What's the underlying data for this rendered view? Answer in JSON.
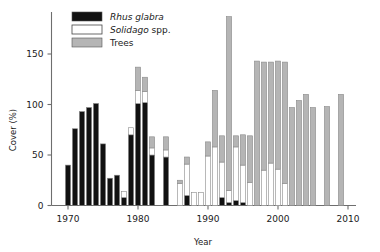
{
  "chart_data": {
    "type": "bar",
    "subtype": "stacked-vertical",
    "title": "",
    "xlabel": "Year",
    "ylabel": "Cover (%)",
    "xlim": [
      1968,
      2010
    ],
    "ylim": [
      0,
      190
    ],
    "xticks": [
      1970,
      1980,
      1990,
      2000,
      2010
    ],
    "yticks": [
      0,
      50,
      100,
      150
    ],
    "grid": false,
    "legend_position": "top-left",
    "legend": [
      {
        "name": "Rhus glabra",
        "italic": true,
        "color": "#111111"
      },
      {
        "name": "Solidago spp.",
        "italic_prefix": "Solidago",
        "plain_suffix": " spp.",
        "color": "#ffffff"
      },
      {
        "name": "Trees",
        "italic": false,
        "color": "#b5b5b5"
      }
    ],
    "categories": [
      1970,
      1971,
      1972,
      1973,
      1974,
      1975,
      1976,
      1977,
      1978,
      1979,
      1980,
      1981,
      1982,
      1983,
      1984,
      1985,
      1986,
      1987,
      1988,
      1989,
      1990,
      1991,
      1992,
      1993,
      1994,
      1995,
      1996,
      1997,
      1998,
      1999,
      2000,
      2001,
      2002,
      2003,
      2004,
      2005,
      2006,
      2007,
      2008,
      2009
    ],
    "series": [
      {
        "name": "Rhus glabra",
        "color": "#111111",
        "values": [
          40,
          76,
          93,
          97,
          101,
          61,
          27,
          30,
          8,
          70,
          101,
          102,
          50,
          0,
          48,
          0,
          0,
          10,
          0,
          0,
          0,
          0,
          8,
          3,
          5,
          3,
          0,
          0,
          0,
          0,
          0,
          0,
          0,
          0,
          0,
          0,
          0,
          0,
          0,
          0
        ]
      },
      {
        "name": "Solidago spp.",
        "color": "#ffffff",
        "values": [
          0,
          0,
          0,
          0,
          0,
          0,
          0,
          0,
          6,
          7,
          13,
          11,
          7,
          0,
          7,
          0,
          22,
          31,
          13,
          13,
          49,
          58,
          35,
          12,
          53,
          37,
          23,
          0,
          35,
          42,
          36,
          22,
          0,
          0,
          0,
          0,
          0,
          0,
          0,
          0
        ]
      },
      {
        "name": "Trees",
        "color": "#b5b5b5",
        "values": [
          0,
          0,
          0,
          0,
          0,
          0,
          0,
          0,
          0,
          0,
          23,
          14,
          11,
          0,
          13,
          0,
          3,
          7,
          0,
          0,
          14,
          56,
          26,
          172,
          11,
          30,
          46,
          143,
          107,
          100,
          107,
          120,
          97,
          104,
          110,
          97,
          0,
          98,
          0,
          110
        ]
      }
    ]
  },
  "axes": {
    "y_label": "Cover (%)",
    "x_label": "Year",
    "y_tick_labels": [
      "0",
      "50",
      "100",
      "150"
    ],
    "x_tick_labels": [
      "1970",
      "1980",
      "1990",
      "2000",
      "2010"
    ]
  }
}
